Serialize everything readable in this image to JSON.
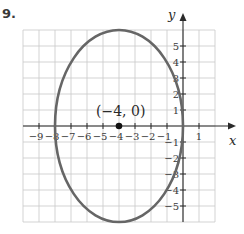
{
  "problem_number": "9.",
  "chart_data": {
    "type": "line",
    "title": "",
    "xlabel": "x",
    "ylabel": "y",
    "xlim": [
      -10,
      2
    ],
    "ylim": [
      -6,
      6
    ],
    "grid": true,
    "x_ticks": [
      "-9",
      "-8",
      "-7",
      "-6",
      "-5",
      "-4",
      "-3",
      "-2",
      "-1",
      "1"
    ],
    "y_ticks": [
      "5",
      "4",
      "3",
      "2",
      "1",
      "-1",
      "-2",
      "-3",
      "-4",
      "-5"
    ],
    "series": [
      {
        "name": "ellipse",
        "shape": "ellipse",
        "center": [
          -4,
          0
        ],
        "radius_x": 4,
        "radius_y": 6,
        "color": "#666666"
      }
    ],
    "points": [
      {
        "x": -4,
        "y": 0,
        "label": "(−4, 0)"
      }
    ],
    "annotations": [
      "(−4, 0)"
    ]
  },
  "colors": {
    "curve": "#666666",
    "grid": "#c8c8c8",
    "axis": "#2a2a2a"
  }
}
